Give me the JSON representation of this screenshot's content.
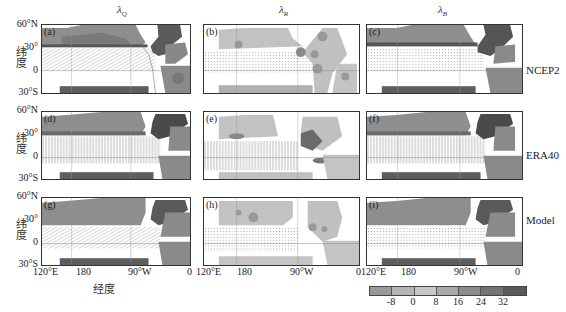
{
  "figure": {
    "column_titles": [
      {
        "symbol": "λ",
        "subscript": "Q"
      },
      {
        "symbol": "λ",
        "subscript": "R"
      },
      {
        "symbol": "λ",
        "subscript": "B"
      }
    ],
    "row_labels": [
      "NCEP2",
      "ERA40",
      "Model"
    ],
    "panel_labels": [
      "(a)",
      "(b)",
      "(c)",
      "(d)",
      "(e)",
      "(f)",
      "(g)",
      "(h)",
      "(i)"
    ],
    "lat_ticks": [
      "60°N",
      "30°",
      "0",
      "30°S"
    ],
    "lon_ticks": [
      "120°E",
      "180",
      "90°W",
      "0"
    ],
    "y_axis_label": "纬度",
    "x_axis_label": "经度"
  },
  "colorbar": {
    "ticks": [
      "-8",
      "0",
      "8",
      "16",
      "24",
      "32"
    ],
    "colors": [
      "#9a9a9a",
      "#b4b4b4",
      "#c8c8c8",
      "#a8a8a8",
      "#8c8c8c",
      "#747474",
      "#5a5a5a"
    ]
  },
  "colors": {
    "light": "#c2c2c2",
    "mid": "#8e8e8e",
    "dark": "#5e5e5e",
    "darker": "#444444",
    "hatch": "#9a9a9a"
  }
}
